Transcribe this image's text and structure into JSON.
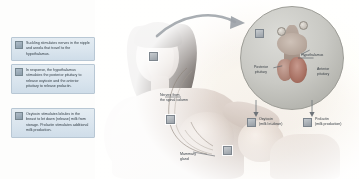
{
  "figure": {
    "accent_color": "#dae5ee",
    "border_color": "#b8c7d4",
    "text_color": "#2f3a42"
  },
  "steps": [
    {
      "number": "1",
      "text": "Suckling stimulates nerves in the nipple and areola that travel to the hypothalamus."
    },
    {
      "number": "2",
      "text": "In response, the hypothalamus stimulates the posterior pituitary to release oxytocin and the anterior pituitary to release prolactin."
    },
    {
      "number": "3",
      "text": "Oxytocin stimulates lobules in the breast to let down (release) milk from storage. Prolactin stimulates additional milk production."
    }
  ],
  "body_labels": {
    "nerves": "Nerves from\nthe spinal column",
    "mammary": "Mammary\ngland"
  },
  "inset": {
    "hypothalamus": "Hypothalamus",
    "posterior_pituitary": "Posterior\npituitary",
    "anterior_pituitary": "Anterior\npituitary"
  },
  "hormones": [
    {
      "name": "Oxytocin",
      "effect": "(milk let-down)"
    },
    {
      "name": "Prolactin",
      "effect": "(milk production)"
    }
  ]
}
